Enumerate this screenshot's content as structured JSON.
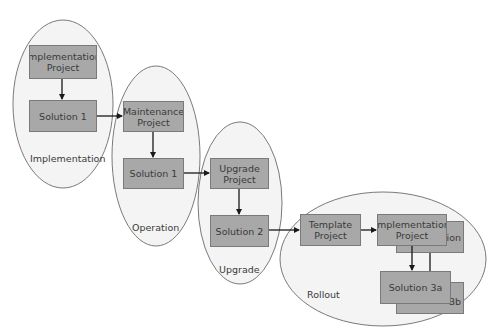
{
  "diagram": {
    "colors": {
      "ellipse_fill": "#f4f4f4",
      "ellipse_stroke": "#7a7a7a",
      "box_fill": "#a8a8a8",
      "box_stroke": "#7a7a7a",
      "text": "#3a3a3a",
      "arrow": "#1a1a1a"
    },
    "phases": [
      {
        "id": "implementation",
        "label": "Implementation"
      },
      {
        "id": "operation",
        "label": "Operation"
      },
      {
        "id": "upgrade",
        "label": "Upgrade"
      },
      {
        "id": "rollout",
        "label": "Rollout"
      }
    ],
    "boxes": {
      "implementation_project": "Implementation\nProject",
      "solution_1_impl": "Solution 1",
      "maintenance_project": "Maintenance\nProject",
      "solution_1_op": "Solution 1",
      "upgrade_project": "Upgrade\nProject",
      "solution_2": "Solution 2",
      "template_project": "Template\nProject",
      "implementation_project_front": "Implementation\nProject",
      "implementation_project_back": "tion",
      "solution_3a": "Solution 3a",
      "solution_3b": "3b"
    }
  }
}
